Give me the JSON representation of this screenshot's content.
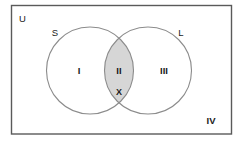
{
  "diagram": {
    "type": "venn-2-set",
    "title_visible": false,
    "universe": {
      "label": "U",
      "name": "universal-set-rectangle"
    },
    "sets": [
      {
        "id": "S",
        "label": "S",
        "side": "left"
      },
      {
        "id": "L",
        "label": "L",
        "side": "right"
      }
    ],
    "regions": [
      {
        "id": "I",
        "label": "I",
        "description": "S only"
      },
      {
        "id": "II",
        "label": "II",
        "description": "S and L intersection",
        "shaded": true
      },
      {
        "id": "III",
        "label": "III",
        "description": "L only"
      },
      {
        "id": "IV",
        "label": "IV",
        "description": "outside both sets"
      }
    ],
    "marks": [
      {
        "id": "X",
        "label": "X",
        "region": "II"
      }
    ],
    "colors": {
      "background": "#ffffff",
      "rect_border": "#5a5a5a",
      "circle_stroke": "#8c8c8c",
      "shading_fill": "#d6d6d6",
      "text": "#1a1a1a"
    }
  }
}
